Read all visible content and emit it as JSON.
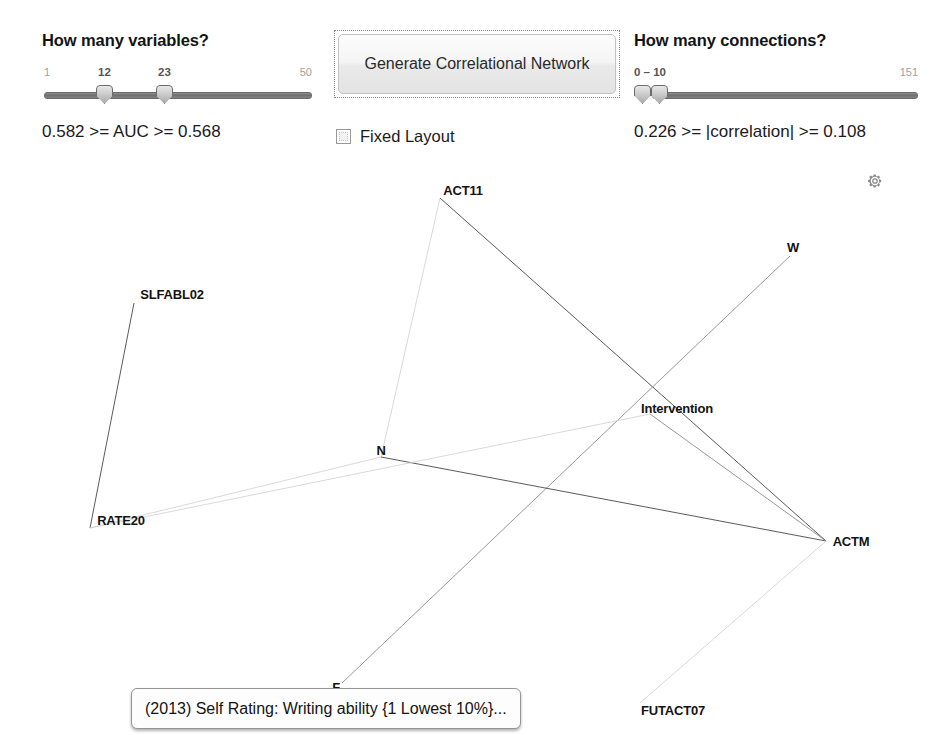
{
  "controls": {
    "variables_panel": {
      "heading": "How many variables?",
      "slider": {
        "name": "variables-range-slider",
        "min_label": "1",
        "max_label": "50",
        "lower_value_label": "12",
        "upper_value_label": "23",
        "min": 1,
        "max": 50,
        "lower_value": 12,
        "upper_value": 23
      },
      "readout": "0.582 >= AUC >= 0.568"
    },
    "generate_panel": {
      "button_label": "Generate Correlational Network",
      "checkbox": {
        "label": "Fixed Layout",
        "checked": false
      }
    },
    "connections_panel": {
      "heading": "How many connections?",
      "slider": {
        "name": "connections-range-slider",
        "min_label": "0 – 10",
        "max_label": "151",
        "min": 0,
        "max": 151,
        "lower_value": 0,
        "upper_value": 10
      },
      "readout": "0.226 >= |correlation| >= 0.108"
    },
    "settings_icon": "gear-icon"
  },
  "graph": {
    "tooltip": "(2013) Self Rating: Writing ability {1 Lowest 10%}...",
    "nodes": [
      {
        "id": "ACT11",
        "label": "ACT11",
        "x": 463,
        "y": 190,
        "anchor_x": 440,
        "anchor_y": 198
      },
      {
        "id": "W",
        "label": "W",
        "x": 793,
        "y": 247,
        "anchor_x": 790,
        "anchor_y": 256
      },
      {
        "id": "SLFABL02",
        "label": "SLFABL02",
        "x": 172,
        "y": 294,
        "anchor_x": 134,
        "anchor_y": 303
      },
      {
        "id": "Intervention",
        "label": "Intervention",
        "x": 677,
        "y": 408,
        "anchor_x": 650,
        "anchor_y": 414
      },
      {
        "id": "N",
        "label": "N",
        "x": 381,
        "y": 450,
        "anchor_x": 381,
        "anchor_y": 457
      },
      {
        "id": "RATE20",
        "label": "RATE20",
        "x": 121,
        "y": 520,
        "anchor_x": 90,
        "anchor_y": 528
      },
      {
        "id": "ACTM",
        "label": "ACTM",
        "x": 851,
        "y": 541,
        "anchor_x": 826,
        "anchor_y": 541
      },
      {
        "id": "F",
        "label": "F",
        "x": 336,
        "y": 687,
        "anchor_x": 342,
        "anchor_y": 683
      },
      {
        "id": "FUTACT07",
        "label": "FUTACT07",
        "x": 673,
        "y": 710,
        "anchor_x": 640,
        "anchor_y": 703
      }
    ],
    "edges": [
      {
        "from": "ACT11",
        "to": "N",
        "weight": "faint"
      },
      {
        "from": "ACT11",
        "to": "ACTM",
        "weight": "strong"
      },
      {
        "from": "W",
        "to": "F",
        "weight": "medium"
      },
      {
        "from": "SLFABL02",
        "to": "RATE20",
        "weight": "strong"
      },
      {
        "from": "RATE20",
        "to": "N",
        "weight": "faint"
      },
      {
        "from": "N",
        "to": "ACTM",
        "weight": "strong"
      },
      {
        "from": "RATE20",
        "to": "Intervention",
        "weight": "faint"
      },
      {
        "from": "Intervention",
        "to": "ACTM",
        "weight": "medium"
      },
      {
        "from": "ACTM",
        "to": "FUTACT07",
        "weight": "faint"
      }
    ]
  },
  "colors": {
    "background": "#ffffff",
    "text": "#1a1a1a",
    "muted_text": "#a0a0a0",
    "edge_strong": "#5a5a5a",
    "edge_medium": "#8c8c8c",
    "edge_faint": "#cfcfcf",
    "slider_track": "#6f6f6f",
    "gear": "#8c8c8c"
  }
}
